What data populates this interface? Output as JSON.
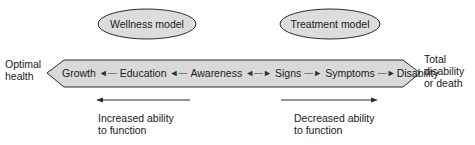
{
  "models": {
    "wellness": {
      "label": "Wellness model"
    },
    "treatment": {
      "label": "Treatment model"
    }
  },
  "endpoints": {
    "left": {
      "line1": "Optimal",
      "line2": "health"
    },
    "right": {
      "line1": "Total",
      "line2": "disability",
      "line3": "or death"
    }
  },
  "continuum": {
    "stages": [
      {
        "label": "Growth"
      },
      {
        "label": "Education"
      },
      {
        "label": "Awareness"
      },
      {
        "label": "Signs"
      },
      {
        "label": "Symptoms"
      },
      {
        "label": "Disability"
      }
    ],
    "connectors": [
      "◄—",
      "◄—",
      "◄—►",
      "—►",
      "—►"
    ]
  },
  "directions": {
    "left": {
      "line1": "Increased ability",
      "line2": "to function"
    },
    "right": {
      "line1": "Decreased ability",
      "line2": "to function"
    }
  },
  "colors": {
    "ellipse_fill": "#dcdcdc",
    "band_fill": "#d9d9d9",
    "stroke": "#2a2a2a",
    "text": "#1a1a1a"
  }
}
